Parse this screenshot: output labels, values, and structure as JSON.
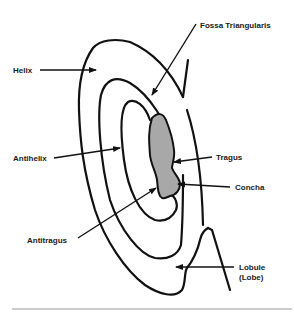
{
  "diagram": {
    "type": "anatomy-ear",
    "labels": {
      "fossa": "Fossa Triangularis",
      "helix": "Helix",
      "antihelix": "Antihelix",
      "tragus": "Tragus",
      "concha": "Concha",
      "antitragus": "Antitragus",
      "lobule_1": "Lobule",
      "lobule_2": "(Lobe)"
    },
    "colors": {
      "line": "#111111",
      "concha_fill": "#a8a8a8",
      "rule": "#999999"
    }
  }
}
